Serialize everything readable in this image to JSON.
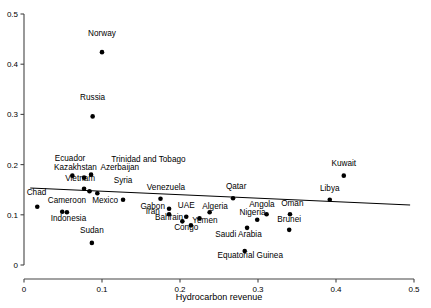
{
  "chart_data": {
    "type": "scatter",
    "title": "",
    "xlabel": "Hydrocarbon revenue",
    "ylabel": "",
    "xlim": [
      0,
      0.5
    ],
    "ylim": [
      0,
      0.5
    ],
    "xticks": [
      "0",
      "0.1",
      "0.2",
      "0.3",
      "0.4",
      "0.5"
    ],
    "xtick_values": [
      0,
      0.1,
      0.2,
      0.3,
      0.4,
      0.5
    ],
    "yticks": [
      "0",
      "0.1",
      "0.2",
      "0.3",
      "0.4",
      "0.5"
    ],
    "ytick_values": [
      0,
      0.1,
      0.2,
      0.3,
      0.4,
      0.5
    ],
    "grid": false,
    "legend": null,
    "marker": "filled-circle",
    "marker_color": "#000000",
    "trendline": {
      "visible": true,
      "color": "#000000",
      "x_start": 0.008,
      "y_start": 0.1535,
      "x_end": 0.495,
      "y_end": 0.1195
    },
    "points": [
      {
        "label": "Norway",
        "x": 0.1,
        "y": 0.424,
        "lx": 0.1,
        "ly": 0.456,
        "anchor": "middle"
      },
      {
        "label": "Russia",
        "x": 0.088,
        "y": 0.296,
        "lx": 0.088,
        "ly": 0.328,
        "anchor": "middle"
      },
      {
        "label": "Ecuador",
        "x": 0.062,
        "y": 0.178,
        "lx": 0.059,
        "ly": 0.207,
        "anchor": "middle"
      },
      {
        "label": "Kazakhstan",
        "x": 0.077,
        "y": 0.174,
        "lx": 0.066,
        "ly": 0.19,
        "anchor": "middle"
      },
      {
        "label": "Trinidad and Tobago",
        "x": 0.086,
        "y": 0.18,
        "lx": 0.112,
        "ly": 0.205,
        "anchor": "start"
      },
      {
        "label": "Azerbaijan",
        "x": 0.084,
        "y": 0.147,
        "lx": 0.098,
        "ly": 0.19,
        "anchor": "start"
      },
      {
        "label": "Vietnam",
        "x": 0.077,
        "y": 0.152,
        "lx": 0.072,
        "ly": 0.168,
        "anchor": "middle"
      },
      {
        "label": "Syria",
        "x": 0.127,
        "y": 0.13,
        "lx": 0.127,
        "ly": 0.163,
        "anchor": "middle"
      },
      {
        "label": "Venezuela",
        "x": 0.175,
        "y": 0.132,
        "lx": 0.182,
        "ly": 0.15,
        "anchor": "middle"
      },
      {
        "label": "Qatar",
        "x": 0.268,
        "y": 0.133,
        "lx": 0.272,
        "ly": 0.152,
        "anchor": "middle"
      },
      {
        "label": "Kuwait",
        "x": 0.41,
        "y": 0.178,
        "lx": 0.41,
        "ly": 0.198,
        "anchor": "middle"
      },
      {
        "label": "Chad",
        "x": 0.017,
        "y": 0.116,
        "lx": 0.016,
        "ly": 0.14,
        "anchor": "middle"
      },
      {
        "label": "Cameroon",
        "x": 0.049,
        "y": 0.106,
        "lx": 0.055,
        "ly": 0.124,
        "anchor": "middle"
      },
      {
        "label": "Mexico",
        "x": 0.094,
        "y": 0.143,
        "lx": 0.104,
        "ly": 0.124,
        "anchor": "middle"
      },
      {
        "label": "Indonesia",
        "x": 0.055,
        "y": 0.105,
        "lx": 0.057,
        "ly": 0.088,
        "anchor": "middle"
      },
      {
        "label": "Sudan",
        "x": 0.087,
        "y": 0.044,
        "lx": 0.087,
        "ly": 0.064,
        "anchor": "middle"
      },
      {
        "label": "Gabon",
        "x": 0.186,
        "y": 0.112,
        "lx": 0.165,
        "ly": 0.112,
        "anchor": "middle"
      },
      {
        "label": "Iran",
        "x": 0.186,
        "y": 0.101,
        "lx": 0.165,
        "ly": 0.101,
        "anchor": "middle"
      },
      {
        "label": "UAE",
        "x": 0.208,
        "y": 0.096,
        "lx": 0.208,
        "ly": 0.114,
        "anchor": "middle"
      },
      {
        "label": "Algeria",
        "x": 0.238,
        "y": 0.105,
        "lx": 0.245,
        "ly": 0.112,
        "anchor": "middle"
      },
      {
        "label": "Bahrain",
        "x": 0.203,
        "y": 0.087,
        "lx": 0.186,
        "ly": 0.09,
        "anchor": "middle"
      },
      {
        "label": "Yemen",
        "x": 0.225,
        "y": 0.093,
        "lx": 0.232,
        "ly": 0.084,
        "anchor": "middle"
      },
      {
        "label": "Congo",
        "x": 0.214,
        "y": 0.079,
        "lx": 0.208,
        "ly": 0.07,
        "anchor": "middle"
      },
      {
        "label": "Saudi Arabia",
        "x": 0.286,
        "y": 0.074,
        "lx": 0.275,
        "ly": 0.056,
        "anchor": "middle"
      },
      {
        "label": "Nigeria",
        "x": 0.299,
        "y": 0.09,
        "lx": 0.293,
        "ly": 0.1,
        "anchor": "middle"
      },
      {
        "label": "Angola",
        "x": 0.311,
        "y": 0.101,
        "lx": 0.305,
        "ly": 0.115,
        "anchor": "middle"
      },
      {
        "label": "Oman",
        "x": 0.341,
        "y": 0.101,
        "lx": 0.344,
        "ly": 0.118,
        "anchor": "middle"
      },
      {
        "label": "Brunei",
        "x": 0.34,
        "y": 0.07,
        "lx": 0.34,
        "ly": 0.086,
        "anchor": "middle"
      },
      {
        "label": "Libya",
        "x": 0.392,
        "y": 0.13,
        "lx": 0.392,
        "ly": 0.147,
        "anchor": "middle"
      },
      {
        "label": "Equatorial Guinea",
        "x": 0.283,
        "y": 0.028,
        "lx": 0.29,
        "ly": 0.013,
        "anchor": "middle"
      }
    ]
  }
}
